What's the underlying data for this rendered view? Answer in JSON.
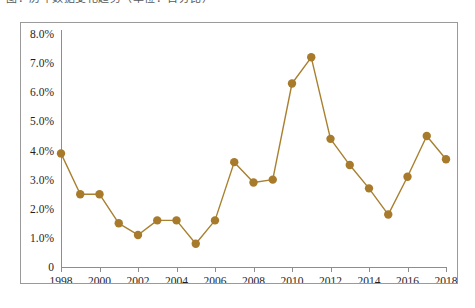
{
  "caption": {
    "text": "图：历年数据变化趋势（单位：百分比）"
  },
  "chart_data": {
    "type": "line",
    "title": "",
    "subtitle": "",
    "xlabel": "",
    "ylabel": "",
    "x": [
      1998,
      1999,
      2000,
      2001,
      2002,
      2003,
      2004,
      2005,
      2006,
      2007,
      2008,
      2009,
      2010,
      2011,
      2012,
      2013,
      2014,
      2015,
      2016,
      2017,
      2018
    ],
    "values": [
      3.9,
      2.5,
      2.5,
      1.5,
      1.1,
      1.6,
      1.6,
      0.8,
      1.6,
      3.6,
      2.9,
      3.0,
      6.3,
      7.2,
      4.4,
      3.5,
      2.7,
      1.8,
      3.1,
      4.5,
      3.7
    ],
    "series": [
      {
        "name": "",
        "values": [
          3.9,
          2.5,
          2.5,
          1.5,
          1.1,
          1.6,
          1.6,
          0.8,
          1.6,
          3.6,
          2.9,
          3.0,
          6.3,
          7.2,
          4.4,
          3.5,
          2.7,
          1.8,
          3.1,
          4.5,
          3.7
        ]
      }
    ],
    "ylim": [
      0,
      8
    ],
    "xlim": [
      1998,
      2018
    ],
    "ytick_values": [
      0,
      1,
      2,
      3,
      4,
      5,
      6,
      7,
      8
    ],
    "ytick_labels": [
      "0",
      "1.0%",
      "2.0%",
      "3.0%",
      "4.0%",
      "5.0%",
      "6.0%",
      "7.0%",
      "8.0%"
    ],
    "xtick_values": [
      1998,
      2000,
      2002,
      2004,
      2006,
      2008,
      2010,
      2012,
      2014,
      2016,
      2018
    ],
    "xtick_labels": [
      "1998",
      "2000",
      "2002",
      "2004",
      "2006",
      "2008",
      "2010",
      "2012",
      "2014",
      "2016",
      "2018"
    ],
    "grid": false,
    "legend": "none",
    "marker": "circle",
    "line_color": "#A8802F",
    "marker_color": "#A87B2C",
    "border_color": "#9A9A9A",
    "axis_color": "#8D8D8D"
  }
}
